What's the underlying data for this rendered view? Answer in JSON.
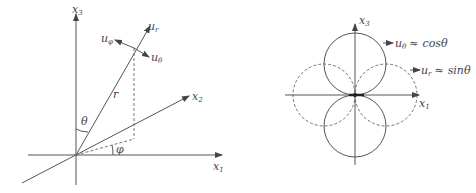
{
  "left_diagram": {
    "axes": {
      "x3": {
        "label": "x",
        "sub": "3"
      },
      "x2": {
        "label": "x",
        "sub": "2"
      },
      "x1": {
        "label": "x",
        "sub": "1"
      }
    },
    "vector_label": "r",
    "theta_label": "θ",
    "phi_label": "φ",
    "unit_vectors": {
      "ur": {
        "label": "u",
        "sub": "r"
      },
      "uphi": {
        "label": "u",
        "sub": "φ"
      },
      "utheta": {
        "label": "u",
        "sub": "θ"
      }
    }
  },
  "right_diagram": {
    "axes": {
      "x3": {
        "label": "x",
        "sub": "3"
      },
      "x1": {
        "label": "x",
        "sub": "1"
      }
    },
    "legend": [
      {
        "symbol": "u",
        "sub": "θ",
        "relation": "≈",
        "expr": "cos",
        "var": "θ",
        "style": "solid"
      },
      {
        "symbol": "u",
        "sub": "r",
        "relation": "≈",
        "expr": "sin",
        "var": "θ",
        "style": "dashed"
      }
    ]
  }
}
